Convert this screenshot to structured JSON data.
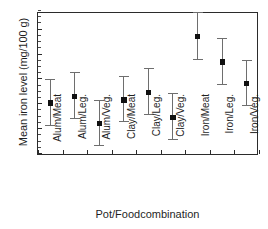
{
  "chart_data": {
    "type": "scatter",
    "title": "",
    "xlabel": "Pot/Foodcombination",
    "ylabel": "Mean iron level (mg/100 g)",
    "ylim": [
      0,
      5.75
    ],
    "yticks": [
      0,
      1,
      2,
      3,
      4,
      5
    ],
    "ytick_labels": [
      "0",
      "1",
      "2",
      "3",
      "4",
      "5"
    ],
    "grid": false,
    "legend": null,
    "error_bars": "vertical, capped (mean with confidence interval)",
    "categories": [
      "Alum/Meat",
      "Alum/Leg.",
      "Alum/Veg.",
      "Clay/Meat",
      "Clay/Leg.",
      "Clay/Veg.",
      "Iron/Meat",
      "Iron/Leg.",
      "Iron/Veg."
    ],
    "values": [
      2.05,
      2.32,
      1.24,
      2.17,
      2.47,
      1.48,
      4.72,
      3.7,
      2.82
    ],
    "error_low": [
      1.14,
      1.42,
      0.33,
      1.27,
      1.55,
      0.56,
      3.79,
      2.78,
      1.92
    ],
    "error_high": [
      2.97,
      3.24,
      2.14,
      3.1,
      3.4,
      2.4,
      5.66,
      4.64,
      3.74
    ],
    "points": [
      {
        "category": "Alum/Meat",
        "mean": 2.05,
        "low": 1.14,
        "high": 2.97
      },
      {
        "category": "Alum/Leg.",
        "mean": 2.32,
        "low": 1.42,
        "high": 3.24
      },
      {
        "category": "Alum/Veg.",
        "mean": 1.24,
        "low": 0.33,
        "high": 2.14
      },
      {
        "category": "Clay/Meat",
        "mean": 2.17,
        "low": 1.27,
        "high": 3.1
      },
      {
        "category": "Clay/Leg.",
        "mean": 2.47,
        "low": 1.55,
        "high": 3.4
      },
      {
        "category": "Clay/Veg.",
        "mean": 1.48,
        "low": 0.56,
        "high": 2.4
      },
      {
        "category": "Iron/Meat",
        "mean": 4.72,
        "low": 3.79,
        "high": 5.66
      },
      {
        "category": "Iron/Leg.",
        "mean": 3.7,
        "low": 2.78,
        "high": 4.64
      },
      {
        "category": "Iron/Veg.",
        "mean": 2.82,
        "low": 1.92,
        "high": 3.74
      }
    ]
  },
  "colors": {
    "marker": "#111111",
    "errorbar": "#6e6e6e",
    "axis": "#2b2b2b",
    "text": "#1f1f1f",
    "background": "#ffffff"
  }
}
